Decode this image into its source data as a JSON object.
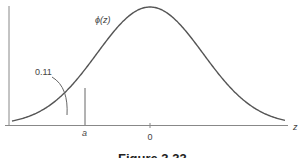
{
  "figure": {
    "caption": "Figure 3.33",
    "curve_label": "ϕ(z)",
    "area_label": "0.11",
    "x_axis_label": "z",
    "tick_labels": {
      "a": "a",
      "zero": "0"
    },
    "colors": {
      "curve": "#555555",
      "axis": "#777777",
      "text": "#444444"
    }
  },
  "chart_data": {
    "type": "line",
    "title": "Figure 3.33",
    "xlabel": "z",
    "ylabel": "ϕ(z)",
    "x_ticks": [
      "a",
      "0"
    ],
    "annotations": [
      {
        "text": "0.11",
        "target": "area left of a"
      },
      {
        "text": "ϕ(z)",
        "target": "curve"
      }
    ],
    "a_value_approx": -1.23,
    "tail_area": 0.11,
    "grid": false,
    "legend": null
  }
}
